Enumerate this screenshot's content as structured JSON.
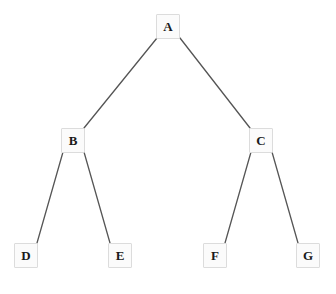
{
  "diagram": {
    "type": "binary-tree",
    "background_color": "#ffffff",
    "node_fill_color": "#fbfbfb",
    "node_border_color": "#dcdcdc",
    "edge_color": "#555555",
    "label_color": "#1a1a1a",
    "node_width": 24,
    "node_height": 25,
    "canvas": {
      "width": 336,
      "height": 294
    },
    "nodes": [
      {
        "id": "a",
        "label": "A",
        "cx": 168,
        "cy": 26,
        "level": 0
      },
      {
        "id": "b",
        "label": "B",
        "cx": 73,
        "cy": 140,
        "level": 1
      },
      {
        "id": "c",
        "label": "C",
        "cx": 261,
        "cy": 140,
        "level": 1
      },
      {
        "id": "d",
        "label": "D",
        "cx": 26,
        "cy": 255,
        "level": 2
      },
      {
        "id": "e",
        "label": "E",
        "cx": 120,
        "cy": 255,
        "level": 2
      },
      {
        "id": "f",
        "label": "F",
        "cx": 215,
        "cy": 255,
        "level": 2
      },
      {
        "id": "g",
        "label": "G",
        "cx": 308,
        "cy": 255,
        "level": 2
      }
    ],
    "edges": [
      {
        "id": "a-b",
        "from": "A",
        "to": "B",
        "x1": 157,
        "y1": 38,
        "x2": 84,
        "y2": 128
      },
      {
        "id": "a-c",
        "from": "A",
        "to": "C",
        "x1": 180,
        "y1": 38,
        "x2": 250,
        "y2": 128
      },
      {
        "id": "b-d",
        "from": "B",
        "to": "D",
        "x1": 63,
        "y1": 152,
        "x2": 37,
        "y2": 243
      },
      {
        "id": "b-e",
        "from": "B",
        "to": "E",
        "x1": 84,
        "y1": 152,
        "x2": 110,
        "y2": 243
      },
      {
        "id": "c-f",
        "from": "C",
        "to": "F",
        "x1": 251,
        "y1": 152,
        "x2": 225,
        "y2": 243
      },
      {
        "id": "c-g",
        "from": "C",
        "to": "G",
        "x1": 272,
        "y1": 152,
        "x2": 298,
        "y2": 243
      }
    ]
  }
}
